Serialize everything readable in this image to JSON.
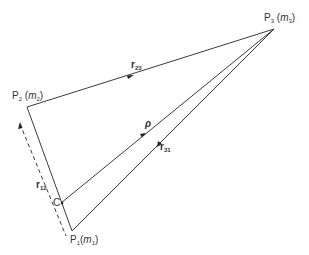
{
  "diagram": {
    "type": "three-body geometry",
    "colors": {
      "line": "#3a3a3a",
      "text": "#333333",
      "background": "#ffffff"
    },
    "points": {
      "P1": {
        "name": "P",
        "sub": "1",
        "mass": "m",
        "mass_sub": "1"
      },
      "P2": {
        "name": "P",
        "sub": "2",
        "mass": "m",
        "mass_sub": "2"
      },
      "P3": {
        "name": "P",
        "sub": "3",
        "mass": "m",
        "mass_sub": "3"
      },
      "C": {
        "name": "C"
      }
    },
    "vectors": {
      "r23": {
        "name": "r",
        "sub": "23"
      },
      "r31": {
        "name": "r",
        "sub": "31"
      },
      "r12": {
        "name": "r",
        "sub": "12"
      },
      "rho": {
        "name": "ρ"
      }
    }
  }
}
